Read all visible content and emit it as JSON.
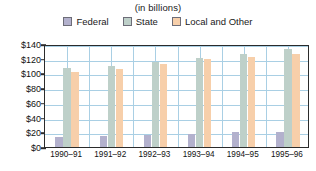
{
  "chart_data": {
    "type": "bar",
    "title": "(in billions)",
    "subtitle": "",
    "xlabel": "",
    "ylabel": "",
    "ylim": [
      0,
      140
    ],
    "ytick_step": 20,
    "ytick_labels": [
      "$140",
      "$120",
      "$100",
      "$80",
      "$60",
      "$40",
      "$20",
      "$0"
    ],
    "ytick_values": [
      140,
      120,
      100,
      80,
      60,
      40,
      20,
      0
    ],
    "grid": true,
    "grid_color": "#a9cfe4",
    "legend_position": "top",
    "categories": [
      "1990–91",
      "1991–92",
      "1992–93",
      "1993–94",
      "1994–95",
      "1995–96"
    ],
    "series": [
      {
        "name": "Federal",
        "color": "#b3b1cd",
        "values": [
          14,
          15,
          17,
          18,
          20,
          20
        ]
      },
      {
        "name": "State",
        "color": "#bed0c9",
        "values": [
          108,
          110,
          116,
          121,
          127,
          133
        ]
      },
      {
        "name": "Local and Other",
        "color": "#f7cfaa",
        "values": [
          102,
          106,
          113,
          120,
          122,
          126
        ]
      }
    ]
  },
  "legend": {
    "items": [
      {
        "label": "Federal",
        "color": "#b3b1cd"
      },
      {
        "label": "State",
        "color": "#bed0c9"
      },
      {
        "label": "Local and Other",
        "color": "#f7cfaa"
      }
    ]
  }
}
